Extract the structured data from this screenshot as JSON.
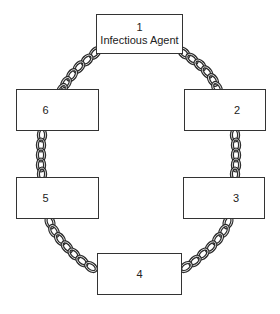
{
  "diagram": {
    "links": [
      {
        "id": 1,
        "number": "1",
        "label": "Infectious Agent"
      },
      {
        "id": 2,
        "number": "2",
        "label": ""
      },
      {
        "id": 3,
        "number": "3",
        "label": ""
      },
      {
        "id": 4,
        "number": "4",
        "label": ""
      },
      {
        "id": 5,
        "number": "5",
        "label": ""
      },
      {
        "id": 6,
        "number": "6",
        "label": ""
      }
    ],
    "connections": [
      {
        "from": 1,
        "to": 2,
        "type": "chain"
      },
      {
        "from": 2,
        "to": 3,
        "type": "chain"
      },
      {
        "from": 3,
        "to": 4,
        "type": "chain"
      },
      {
        "from": 4,
        "to": 5,
        "type": "chain"
      },
      {
        "from": 5,
        "to": 6,
        "type": "chain"
      },
      {
        "from": 6,
        "to": 1,
        "type": "chain"
      }
    ],
    "colors": {
      "stroke": "#333333",
      "background": "#ffffff"
    }
  }
}
